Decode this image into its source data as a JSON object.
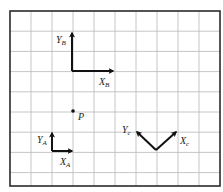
{
  "diagram": {
    "type": "coordinate-frames-on-grid",
    "grid": {
      "columns": 10,
      "rows": 9
    },
    "colors": {
      "grid": "#b8b8b8",
      "border": "#2a2a2a",
      "axes": "#111111",
      "text": "#222222"
    },
    "point": {
      "label": "P"
    },
    "frames": [
      {
        "id": "A",
        "x_label": {
          "main": "X",
          "sub": "A"
        },
        "y_label": {
          "main": "Y",
          "sub": "A"
        },
        "orientation_deg": 0
      },
      {
        "id": "B",
        "x_label": {
          "main": "X",
          "sub": "B"
        },
        "y_label": {
          "main": "Y",
          "sub": "B"
        },
        "orientation_deg": 0
      },
      {
        "id": "C",
        "x_label": {
          "main": "X",
          "sub": "c"
        },
        "y_label": {
          "main": "Y",
          "sub": "c"
        },
        "orientation_deg": 45
      }
    ]
  }
}
